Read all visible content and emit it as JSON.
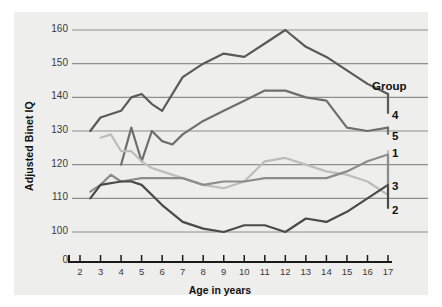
{
  "chart_data": {
    "type": "line",
    "title": "",
    "xlabel": "Age in years",
    "ylabel": "Adjusted Binet IQ",
    "xlim": [
      1.2,
      17.8
    ],
    "ylim": [
      96,
      163
    ],
    "grid": true,
    "y_ticks": [
      100,
      110,
      120,
      130,
      140,
      150,
      160
    ],
    "y_axis_origin_label": "0",
    "x_ticks": [
      2,
      3,
      4,
      5,
      6,
      7,
      8,
      9,
      10,
      11,
      12,
      13,
      14,
      15,
      16,
      17
    ],
    "legend_position": "right",
    "legend_title": "Group",
    "legend_entries": [
      {
        "label": "4",
        "color": "#5a5a5a"
      },
      {
        "label": "5",
        "color": "#6e6e6e"
      },
      {
        "label": "1",
        "color": "#bdbdbd"
      },
      {
        "label": "3",
        "color": "#8c8c8c"
      },
      {
        "label": "2",
        "color": "#4a4a4a"
      }
    ],
    "series": [
      {
        "name": "4",
        "color": "#5a5a5a",
        "x": [
          2.5,
          3,
          4,
          4.5,
          5,
          5.5,
          6,
          7,
          8,
          9,
          10,
          11,
          12,
          13,
          14,
          15,
          16,
          17
        ],
        "values": [
          130,
          134,
          136,
          140,
          141,
          138,
          136,
          146,
          150,
          153,
          152,
          156,
          160,
          155,
          152,
          148,
          144,
          141
        ]
      },
      {
        "name": "5",
        "color": "#6e6e6e",
        "x": [
          4,
          4.5,
          5,
          5.5,
          6,
          6.5,
          7,
          8,
          9,
          10,
          11,
          12,
          13,
          14,
          15,
          16,
          17
        ],
        "values": [
          120,
          131,
          121,
          130,
          127,
          126,
          129,
          133,
          136,
          139,
          142,
          142,
          140,
          139,
          131,
          130,
          131
        ]
      },
      {
        "name": "1",
        "color": "#bdbdbd",
        "x": [
          3,
          3.5,
          4,
          4.5,
          5,
          5.5,
          6,
          7,
          8,
          9,
          10,
          11,
          12,
          13,
          14,
          15,
          16,
          17
        ],
        "values": [
          128,
          129,
          124,
          124,
          121,
          119,
          118,
          116,
          114,
          113,
          115,
          121,
          122,
          120,
          118,
          117,
          115,
          111
        ]
      },
      {
        "name": "3",
        "color": "#8c8c8c",
        "x": [
          2.5,
          3,
          3.5,
          4,
          5,
          6,
          7,
          8,
          9,
          10,
          11,
          12,
          13,
          14,
          15,
          16,
          17
        ],
        "values": [
          112,
          114,
          117,
          115,
          116,
          116,
          116,
          114,
          115,
          115,
          116,
          116,
          116,
          116,
          118,
          121,
          123
        ]
      },
      {
        "name": "2",
        "color": "#4a4a4a",
        "x": [
          2.5,
          3,
          4,
          4.5,
          5,
          6,
          7,
          8,
          9,
          10,
          11,
          12,
          13,
          14,
          15,
          16,
          17
        ],
        "values": [
          110,
          114,
          115,
          115,
          114,
          108,
          103,
          101,
          100,
          102,
          102,
          100,
          104,
          103,
          106,
          110,
          114
        ]
      }
    ]
  }
}
